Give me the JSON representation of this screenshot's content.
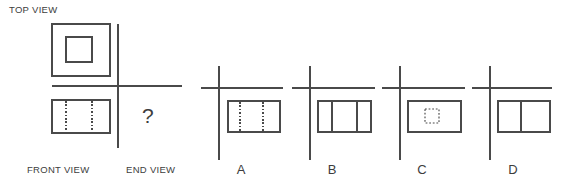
{
  "figure": {
    "type": "orthographic-projection-puzzle",
    "background_color": "#ffffff",
    "line_color": "#4a4a4a"
  },
  "labels": {
    "top_view": "TOP VIEW",
    "front_view": "FRONT VIEW",
    "end_view": "END VIEW",
    "question_mark": "?"
  },
  "given": {
    "top_view": {
      "description": "square with concentric inner square",
      "outer": {
        "x": 52,
        "y": 24,
        "w": 58,
        "h": 52
      },
      "inner": {
        "x": 66,
        "y": 37,
        "w": 26,
        "h": 25
      }
    },
    "front_view": {
      "description": "rectangle with two vertical hidden (dotted) lines",
      "rect": {
        "x": 52,
        "y": 100,
        "w": 58,
        "h": 33
      },
      "hidden_lines_x": [
        66,
        92
      ]
    },
    "axes": {
      "vertical_x": 118,
      "vertical_y1": 24,
      "vertical_y2": 148,
      "horizontal_y": 86,
      "horizontal_x1": 52,
      "horizontal_x2": 182
    }
  },
  "options": [
    {
      "letter": "A",
      "description": "rectangle with two vertical hidden (dotted) lines",
      "content": "two-dotted-lines",
      "axis": {
        "vx": 219,
        "vy1": 66,
        "vy2": 160,
        "hy": 88,
        "hx1": 201,
        "hx2": 283
      },
      "rect": {
        "x": 228,
        "y": 101,
        "w": 52,
        "h": 31
      },
      "hidden_lines_x": [
        240,
        263
      ],
      "letter_x": 240,
      "letter_y": 163
    },
    {
      "letter": "B",
      "description": "rectangle with two vertical solid lines",
      "content": "two-solid-lines",
      "axis": {
        "vx": 310,
        "vy1": 66,
        "vy2": 160,
        "hy": 88,
        "hx1": 292,
        "hx2": 375
      },
      "rect": {
        "x": 318,
        "y": 101,
        "w": 53,
        "h": 31
      },
      "solid_lines_x": [
        332,
        357
      ],
      "letter_x": 331,
      "letter_y": 163
    },
    {
      "letter": "C",
      "description": "rectangle with small dotted square in center",
      "content": "center-dotted-square",
      "axis": {
        "vx": 400,
        "vy1": 66,
        "vy2": 160,
        "hy": 88,
        "hx1": 382,
        "hx2": 465
      },
      "rect": {
        "x": 408,
        "y": 101,
        "w": 53,
        "h": 31
      },
      "inner_dotted": {
        "x": 425,
        "y": 109,
        "w": 14,
        "h": 14
      },
      "letter_x": 422,
      "letter_y": 163
    },
    {
      "letter": "D",
      "description": "rectangle with one vertical solid line",
      "content": "one-solid-line",
      "axis": {
        "vx": 490,
        "vy1": 66,
        "vy2": 160,
        "hy": 88,
        "hx1": 472,
        "hx2": 552
      },
      "rect": {
        "x": 498,
        "y": 101,
        "w": 52,
        "h": 31
      },
      "solid_lines_x": [
        521
      ],
      "letter_x": 512,
      "letter_y": 163
    }
  ]
}
